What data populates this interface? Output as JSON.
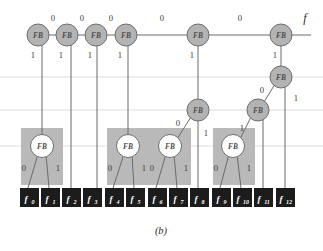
{
  "figure": {
    "caption": "(b)",
    "output_label": "f",
    "node_label": "FB",
    "colors": {
      "node_fill_gray": "#b3b3b3",
      "node_fill_white": "#ffffff",
      "node_stroke": "#6e6e6e",
      "group_box": "#b9b9b9",
      "leaf_box": "#1c1c1c",
      "leaf_text": "#ffffff",
      "edge": "#5a5a5a",
      "gridline": "#d8d8d8",
      "background": "#ffffff"
    },
    "leaves": [
      {
        "name": "f0",
        "base": "f",
        "sub": "0",
        "x": 27,
        "y": 197
      },
      {
        "name": "f1",
        "base": "f",
        "sub": "1",
        "x": 48,
        "y": 197
      },
      {
        "name": "f2",
        "base": "f",
        "sub": "2",
        "x": 69,
        "y": 197
      },
      {
        "name": "f3",
        "base": "f",
        "sub": "3",
        "x": 90,
        "y": 197
      },
      {
        "name": "f4",
        "base": "f",
        "sub": "4",
        "x": 112,
        "y": 197
      },
      {
        "name": "f5",
        "base": "f",
        "sub": "5",
        "x": 133,
        "y": 197
      },
      {
        "name": "f6",
        "base": "f",
        "sub": "6",
        "x": 155,
        "y": 197
      },
      {
        "name": "f7",
        "base": "f",
        "sub": "7",
        "x": 176,
        "y": 197
      },
      {
        "name": "f8",
        "base": "f",
        "sub": "8",
        "x": 197,
        "y": 197
      },
      {
        "name": "f9",
        "base": "f",
        "sub": "9",
        "x": 219,
        "y": 197
      },
      {
        "name": "f10",
        "base": "f",
        "sub": "10",
        "x": 240,
        "y": 197
      },
      {
        "name": "f11",
        "base": "f",
        "sub": "11",
        "x": 261,
        "y": 197
      },
      {
        "name": "f12",
        "base": "f",
        "sub": "12",
        "x": 283,
        "y": 197
      }
    ],
    "top_row_nodes": [
      {
        "id": "t0",
        "x": 38,
        "y": 35
      },
      {
        "id": "t1",
        "x": 67,
        "y": 35
      },
      {
        "id": "t2",
        "x": 96,
        "y": 35
      },
      {
        "id": "t3",
        "x": 126,
        "y": 35
      },
      {
        "id": "t4",
        "x": 198,
        "y": 35
      },
      {
        "id": "t5",
        "x": 281,
        "y": 35
      }
    ],
    "mid_nodes": [
      {
        "id": "m0",
        "x": 281,
        "y": 77,
        "fill": "gray"
      },
      {
        "id": "m1",
        "x": 198,
        "y": 110,
        "fill": "gray"
      },
      {
        "id": "m2",
        "x": 258,
        "y": 110,
        "fill": "gray"
      }
    ],
    "low_nodes": [
      {
        "id": "l0",
        "x": 42,
        "y": 146,
        "fill": "white"
      },
      {
        "id": "l1",
        "x": 128,
        "y": 146,
        "fill": "white"
      },
      {
        "id": "l2",
        "x": 170,
        "y": 146,
        "fill": "white"
      },
      {
        "id": "l3",
        "x": 233,
        "y": 146,
        "fill": "white"
      }
    ],
    "group_boxes": [
      {
        "id": "g0",
        "x": 21,
        "y": 128,
        "w": 42,
        "h": 57
      },
      {
        "id": "g1",
        "x": 107,
        "y": 128,
        "w": 42,
        "h": 57
      },
      {
        "id": "g2",
        "x": 149,
        "y": 128,
        "w": 42,
        "h": 57
      },
      {
        "id": "g3",
        "x": 213,
        "y": 128,
        "w": 42,
        "h": 57
      }
    ],
    "gridlines_y": [
      77,
      110,
      146
    ],
    "edge_labels_zero_top": [
      {
        "value": "0",
        "x": 53,
        "y": 21
      },
      {
        "value": "0",
        "x": 82,
        "y": 21
      },
      {
        "value": "0",
        "x": 111,
        "y": 21
      },
      {
        "value": "0",
        "x": 162,
        "y": 21
      },
      {
        "value": "0",
        "x": 240,
        "y": 21
      }
    ],
    "edge_labels_one_top": [
      {
        "value": "1",
        "x": 33,
        "y": 58
      },
      {
        "value": "1",
        "x": 61,
        "y": 58
      },
      {
        "value": "1",
        "x": 90,
        "y": 58
      },
      {
        "value": "1",
        "x": 120,
        "y": 58
      },
      {
        "value": "1",
        "x": 192,
        "y": 58
      },
      {
        "value": "1",
        "x": 275,
        "y": 58
      }
    ],
    "edge_labels_other": [
      {
        "value": "0",
        "x": 262,
        "y": 93
      },
      {
        "value": "1",
        "x": 296,
        "y": 101
      },
      {
        "value": "0",
        "x": 178,
        "y": 126
      },
      {
        "value": "1",
        "x": 204,
        "y": 136
      },
      {
        "value": "1",
        "x": 240,
        "y": 131
      },
      {
        "value": "0",
        "x": 24,
        "y": 171
      },
      {
        "value": "1",
        "x": 57,
        "y": 171
      },
      {
        "value": "0",
        "x": 110,
        "y": 171
      },
      {
        "value": "1",
        "x": 143,
        "y": 171
      },
      {
        "value": "0",
        "x": 152,
        "y": 171
      },
      {
        "value": "1",
        "x": 185,
        "y": 171
      },
      {
        "value": "0",
        "x": 216,
        "y": 171
      },
      {
        "value": "1",
        "x": 248,
        "y": 171
      }
    ]
  }
}
